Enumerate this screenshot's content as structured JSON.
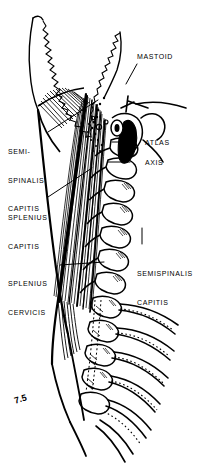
{
  "figure": {
    "type": "anatomical-illustration",
    "figure_number": "7.5",
    "style": "black-and-white pen-and-ink line drawing",
    "background_color": "#ffffff",
    "ink_color": "#000000"
  },
  "labels": {
    "mastoid": {
      "text": "MASTOID",
      "side": "right"
    },
    "atlas": {
      "text": "ATLAS",
      "side": "right"
    },
    "axis": {
      "text": "AXIS",
      "side": "right"
    },
    "semispinalis_capitis_right": {
      "line1": "SEMISPINALIS",
      "line2": "CAPITIS",
      "side": "right"
    },
    "semi_spinalis_capitis_left": {
      "line1": "SEMI-",
      "line2": "SPINALIS",
      "line3": "CAPITIS",
      "side": "left"
    },
    "splenius_capitis": {
      "line1": "SPLENIUS",
      "line2": "CAPITIS",
      "side": "left"
    },
    "splenius_cervicis": {
      "line1": "SPLENIUS",
      "line2": "CERVICIS",
      "side": "left"
    }
  },
  "structures": [
    "occipital bone with lambdoid suture",
    "mastoid process",
    "mandible ramus",
    "atlas (C1) vertebra",
    "axis (C2) vertebra",
    "cervical vertebrae C3-C7",
    "thoracic vertebrae with ribs",
    "splenius capitis muscle",
    "splenius cervicis muscle",
    "semispinalis capitis muscle"
  ]
}
